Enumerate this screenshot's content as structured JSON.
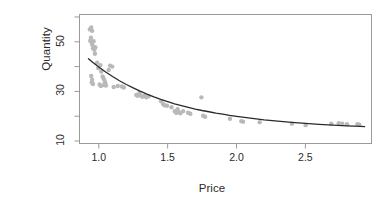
{
  "chart_data": {
    "type": "scatter",
    "title": "",
    "subtitle": "",
    "xlabel": "Price",
    "ylabel": "Quantity",
    "xlim": [
      0.86,
      2.98
    ],
    "ylim": [
      9.0,
      61.0
    ],
    "grid": false,
    "legend": null,
    "xticks": [
      1.0,
      1.5,
      2.0,
      2.5
    ],
    "xtick_labels": [
      "1.0",
      "1.5",
      "2.0",
      "2.5"
    ],
    "yticks": [
      10,
      20,
      30,
      40,
      50,
      60
    ],
    "ytick_labels": [
      "10",
      "",
      "30",
      "",
      "50",
      ""
    ],
    "ytick_labels_shown": [
      "10",
      "30",
      "50"
    ],
    "point_color": "#b9b9b9",
    "point_size": 4.4,
    "line_color": "#2a2a2a",
    "line_width": 1.3,
    "box_color": "#9a9a9a",
    "series": [
      {
        "name": "observations",
        "type": "scatter",
        "points": [
          [
            0.935,
            55.0
          ],
          [
            0.945,
            55.8
          ],
          [
            0.952,
            54.4
          ],
          [
            0.943,
            51.6
          ],
          [
            0.938,
            50.4
          ],
          [
            0.948,
            49.6
          ],
          [
            0.955,
            48.6
          ],
          [
            0.962,
            50.2
          ],
          [
            0.958,
            47.4
          ],
          [
            0.968,
            46.8
          ],
          [
            0.975,
            47.8
          ],
          [
            0.972,
            45.2
          ],
          [
            0.945,
            36.2
          ],
          [
            0.952,
            34.6
          ],
          [
            0.949,
            33.6
          ],
          [
            0.958,
            33.0
          ],
          [
            0.988,
            41.6
          ],
          [
            0.996,
            39.4
          ],
          [
            1.012,
            40.6
          ],
          [
            1.018,
            38.0
          ],
          [
            1.028,
            36.0
          ],
          [
            1.035,
            35.2
          ],
          [
            1.042,
            34.2
          ],
          [
            1.048,
            33.4
          ],
          [
            1.038,
            32.6
          ],
          [
            1.052,
            32.4
          ],
          [
            1.006,
            32.8
          ],
          [
            1.015,
            32.2
          ],
          [
            1.072,
            38.6
          ],
          [
            1.082,
            40.4
          ],
          [
            1.098,
            40.0
          ],
          [
            1.108,
            31.8
          ],
          [
            1.138,
            32.2
          ],
          [
            1.168,
            32.0
          ],
          [
            1.182,
            31.6
          ],
          [
            1.272,
            28.6
          ],
          [
            1.282,
            28.2
          ],
          [
            1.295,
            29.4
          ],
          [
            1.305,
            28.4
          ],
          [
            1.315,
            27.8
          ],
          [
            1.332,
            28.2
          ],
          [
            1.345,
            27.6
          ],
          [
            1.362,
            28.0
          ],
          [
            1.452,
            26.0
          ],
          [
            1.468,
            24.8
          ],
          [
            1.478,
            24.4
          ],
          [
            1.495,
            24.2
          ],
          [
            1.528,
            23.6
          ],
          [
            1.552,
            22.0
          ],
          [
            1.562,
            21.4
          ],
          [
            1.572,
            22.8
          ],
          [
            1.582,
            21.6
          ],
          [
            1.592,
            21.2
          ],
          [
            1.612,
            22.0
          ],
          [
            1.648,
            21.4
          ],
          [
            1.665,
            21.0
          ],
          [
            1.745,
            27.6
          ],
          [
            1.758,
            20.2
          ],
          [
            1.772,
            19.8
          ],
          [
            1.952,
            19.0
          ],
          [
            2.035,
            18.0
          ],
          [
            2.048,
            17.8
          ],
          [
            2.168,
            17.6
          ],
          [
            2.402,
            17.0
          ],
          [
            2.502,
            16.4
          ],
          [
            2.688,
            17.0
          ],
          [
            2.742,
            17.2
          ],
          [
            2.768,
            17.0
          ],
          [
            2.802,
            16.8
          ],
          [
            2.878,
            16.8
          ],
          [
            2.892,
            16.6
          ]
        ]
      },
      {
        "name": "fitted-curve",
        "type": "line",
        "note": "power/exponential decay fit through scatter",
        "points": [
          [
            0.925,
            43.2
          ],
          [
            0.96,
            41.6
          ],
          [
            1.0,
            39.8
          ],
          [
            1.05,
            37.8
          ],
          [
            1.1,
            36.0
          ],
          [
            1.15,
            34.3
          ],
          [
            1.2,
            32.8
          ],
          [
            1.25,
            31.4
          ],
          [
            1.3,
            30.1
          ],
          [
            1.35,
            28.9
          ],
          [
            1.4,
            27.8
          ],
          [
            1.45,
            26.8
          ],
          [
            1.5,
            25.9
          ],
          [
            1.55,
            25.0
          ],
          [
            1.6,
            24.3
          ],
          [
            1.65,
            23.6
          ],
          [
            1.7,
            22.9
          ],
          [
            1.75,
            22.3
          ],
          [
            1.8,
            21.8
          ],
          [
            1.85,
            21.2
          ],
          [
            1.9,
            20.8
          ],
          [
            1.95,
            20.3
          ],
          [
            2.0,
            19.9
          ],
          [
            2.1,
            19.2
          ],
          [
            2.2,
            18.5
          ],
          [
            2.3,
            18.0
          ],
          [
            2.4,
            17.5
          ],
          [
            2.5,
            17.1
          ],
          [
            2.6,
            16.7
          ],
          [
            2.7,
            16.4
          ],
          [
            2.8,
            16.1
          ],
          [
            2.9,
            15.9
          ],
          [
            2.93,
            15.8
          ]
        ]
      }
    ]
  },
  "axes": {
    "y_title": "Quantity",
    "x_title": "Price",
    "y_tick_labels": [
      {
        "value": 50,
        "text": "50"
      },
      {
        "value": 30,
        "text": "30"
      },
      {
        "value": 10,
        "text": "10"
      }
    ],
    "x_tick_labels": [
      {
        "value": 1.0,
        "text": "1.0"
      },
      {
        "value": 1.5,
        "text": "1.5"
      },
      {
        "value": 2.0,
        "text": "2.0"
      },
      {
        "value": 2.5,
        "text": "2.5"
      }
    ]
  }
}
